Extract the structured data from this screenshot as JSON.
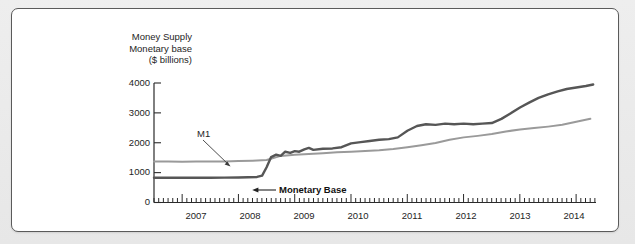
{
  "figure": {
    "title_lines": [
      "Money Supply",
      "Monetary base",
      "($ billions)"
    ],
    "background": "#e9e9e9",
    "panel_background": "#ffffff",
    "frame_color": "#5a5a5a"
  },
  "annotations": {
    "m1": "M1",
    "monetary_base": "Monetary Base"
  },
  "axis": {
    "y_ticks": [
      "0",
      "1000",
      "2000",
      "3000",
      "4000"
    ],
    "x_ticks": [
      "2007",
      "2008",
      "2009",
      "2010",
      "2011",
      "2012",
      "2013",
      "2014"
    ]
  },
  "chart_data": {
    "type": "line",
    "title": "Money Supply Monetary base ($ billions)",
    "xlabel": "",
    "ylabel": "($ billions)",
    "ylim": [
      0,
      4000
    ],
    "xlim": [
      2006.5,
      2014.35
    ],
    "grid": false,
    "legend": "inline-annotations",
    "y_ticks": [
      0,
      1000,
      2000,
      3000,
      4000
    ],
    "x_ticks": [
      2007,
      2008,
      2009,
      2010,
      2011,
      2012,
      2013,
      2014
    ],
    "minor_x_tick_interval": 0.0833,
    "annotations": [
      {
        "text": "M1",
        "x": 2007.6,
        "y": 2280,
        "arrow_to_x": 2008.15,
        "arrow_to_y": 1420
      },
      {
        "text": "Monetary Base",
        "x": 2009.2,
        "y": 560,
        "arrow_to_x": 2008.45,
        "arrow_to_y": 870
      }
    ],
    "series": [
      {
        "name": "M1",
        "color": "#9a9a9a",
        "width": 2.0,
        "x": [
          2006.5,
          2006.75,
          2007.0,
          2007.25,
          2007.5,
          2007.75,
          2008.0,
          2008.25,
          2008.5,
          2008.75,
          2009.0,
          2009.25,
          2009.5,
          2009.75,
          2010.0,
          2010.25,
          2010.5,
          2010.75,
          2011.0,
          2011.25,
          2011.5,
          2011.75,
          2012.0,
          2012.25,
          2012.5,
          2012.75,
          2013.0,
          2013.25,
          2013.5,
          2013.75,
          2014.0,
          2014.25
        ],
        "values": [
          1375,
          1370,
          1365,
          1370,
          1370,
          1375,
          1385,
          1400,
          1420,
          1560,
          1600,
          1620,
          1650,
          1680,
          1700,
          1720,
          1745,
          1790,
          1850,
          1920,
          1990,
          2100,
          2180,
          2230,
          2290,
          2380,
          2440,
          2490,
          2540,
          2600,
          2700,
          2800
        ]
      },
      {
        "name": "Monetary Base",
        "color": "#565656",
        "width": 2.4,
        "x": [
          2006.5,
          2006.75,
          2007.0,
          2007.25,
          2007.5,
          2007.75,
          2008.0,
          2008.17,
          2008.33,
          2008.42,
          2008.5,
          2008.58,
          2008.67,
          2008.75,
          2008.83,
          2008.92,
          2009.0,
          2009.08,
          2009.17,
          2009.25,
          2009.33,
          2009.5,
          2009.67,
          2009.83,
          2010.0,
          2010.17,
          2010.33,
          2010.5,
          2010.67,
          2010.83,
          2011.0,
          2011.17,
          2011.33,
          2011.5,
          2011.67,
          2011.83,
          2012.0,
          2012.17,
          2012.33,
          2012.5,
          2012.67,
          2012.83,
          2013.0,
          2013.17,
          2013.33,
          2013.5,
          2013.67,
          2013.83,
          2014.0,
          2014.17,
          2014.3
        ],
        "values": [
          830,
          828,
          826,
          828,
          830,
          832,
          838,
          845,
          855,
          900,
          1180,
          1520,
          1600,
          1560,
          1700,
          1660,
          1720,
          1700,
          1780,
          1830,
          1760,
          1800,
          1810,
          1850,
          1980,
          2020,
          2060,
          2100,
          2120,
          2180,
          2400,
          2560,
          2620,
          2600,
          2640,
          2620,
          2640,
          2620,
          2640,
          2660,
          2800,
          2980,
          3180,
          3350,
          3500,
          3620,
          3720,
          3800,
          3850,
          3900,
          3950
        ]
      }
    ]
  }
}
